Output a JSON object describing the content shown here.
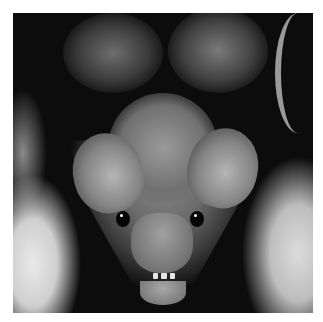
{
  "image": {
    "subject": "close-up photo of a bat's face (front view)",
    "style": "black and white photograph",
    "border_color": "#ffffff",
    "background_color": "#0c0c0c"
  }
}
